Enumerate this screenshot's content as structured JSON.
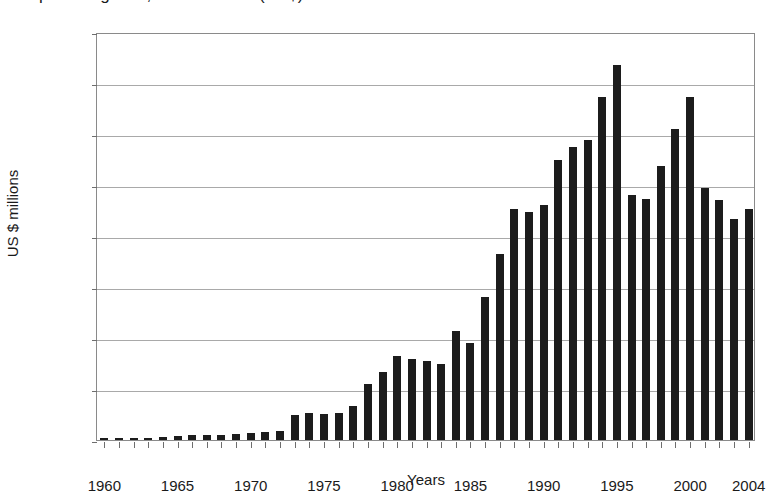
{
  "chart_data": {
    "type": "bar",
    "title": "Imports of goods, current value (US$)",
    "xlabel": "Years",
    "ylabel": "US $ millions",
    "ylim": [
      0,
      16000
    ],
    "ytick_step": 2000,
    "yticks": [
      0,
      2000,
      4000,
      6000,
      8000,
      10000,
      12000,
      14000,
      16000
    ],
    "grid": true,
    "legend": "none",
    "xtick_labels": [
      "1960",
      "1965",
      "1970",
      "1975",
      "1980",
      "1985",
      "1990",
      "1995",
      "2000",
      "2004"
    ],
    "xtick_years": [
      1960,
      1965,
      1970,
      1975,
      1980,
      1985,
      1990,
      1995,
      2000,
      2004
    ],
    "bar_color": "#1c1c1c",
    "gridline_color": "#a9a9a9",
    "axis_color": "#8a8a8a",
    "categories": [
      1960,
      1961,
      1962,
      1963,
      1964,
      1965,
      1966,
      1967,
      1968,
      1969,
      1970,
      1971,
      1972,
      1973,
      1974,
      1975,
      1976,
      1977,
      1978,
      1979,
      1980,
      1981,
      1982,
      1983,
      1984,
      1985,
      1986,
      1987,
      1988,
      1989,
      1990,
      1991,
      1992,
      1993,
      1994,
      1995,
      1996,
      1997,
      1998,
      1999,
      2000,
      2001,
      2002,
      2003,
      2004
    ],
    "values": [
      80,
      80,
      85,
      90,
      110,
      140,
      190,
      200,
      215,
      230,
      260,
      300,
      360,
      980,
      1050,
      1030,
      1070,
      1320,
      2200,
      2650,
      3300,
      3160,
      3080,
      3000,
      4280,
      3800,
      5600,
      7300,
      9050,
      8950,
      9200,
      11000,
      11500,
      11750,
      13450,
      14700,
      9600,
      9450,
      10750,
      12200,
      13450,
      9900,
      9400,
      8650,
      9050
    ]
  }
}
